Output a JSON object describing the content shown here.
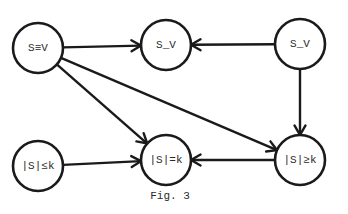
{
  "figure": {
    "caption": "Fig. 3",
    "stroke_color": "#1a1a1a",
    "background": "#ffffff"
  },
  "nodes": [
    {
      "id": "n1",
      "label": "S≡V",
      "cx": 38,
      "cy": 48,
      "r": 25
    },
    {
      "id": "n2",
      "label": "S_V",
      "cx": 166,
      "cy": 45,
      "r": 25
    },
    {
      "id": "n3",
      "label": "S_V",
      "cx": 300,
      "cy": 44,
      "r": 25
    },
    {
      "id": "n4",
      "label": "|S|≤k",
      "cx": 38,
      "cy": 166,
      "r": 25
    },
    {
      "id": "n5",
      "label": "|S|=k",
      "cx": 166,
      "cy": 160,
      "r": 25
    },
    {
      "id": "n6",
      "label": "|S|≥k",
      "cx": 300,
      "cy": 160,
      "r": 25
    }
  ],
  "edges": [
    {
      "from": "n1",
      "to": "n2"
    },
    {
      "from": "n3",
      "to": "n2"
    },
    {
      "from": "n1",
      "to": "n5"
    },
    {
      "from": "n1",
      "to": "n6"
    },
    {
      "from": "n3",
      "to": "n6"
    },
    {
      "from": "n4",
      "to": "n5"
    },
    {
      "from": "n6",
      "to": "n5"
    }
  ]
}
